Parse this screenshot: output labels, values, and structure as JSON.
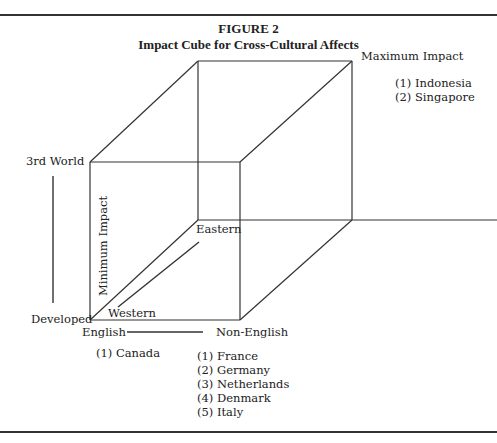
{
  "figure": {
    "number": "FIGURE 2",
    "title": "Impact Cube for Cross-Cultural Affects"
  },
  "labels": {
    "maximum_impact": "Maximum Impact",
    "minimum_impact": "Minimum Impact",
    "third_world": "3rd World",
    "developed": "Developed",
    "eastern": "Eastern",
    "western": "Western",
    "english": "English",
    "non_english": "Non-English"
  },
  "lists": {
    "maximum_impact_countries": [
      "(1) Indonesia",
      "(2) Singapore"
    ],
    "english_countries": [
      "(1) Canada"
    ],
    "non_english_countries": [
      "(1) France",
      "(2) Germany",
      "(3) Netherlands",
      "(4) Denmark",
      "(5) Italy"
    ]
  },
  "colors": {
    "line": "#333333",
    "text": "#222222",
    "background": "#ffffff"
  }
}
